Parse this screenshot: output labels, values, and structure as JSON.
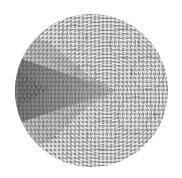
{
  "image": {
    "description": "Circular grayscale hyperbolic tiling pattern with a darker wedge pointing right from the left edge",
    "background_color": "#ffffff",
    "disc": {
      "center_x": 91,
      "center_y": 90,
      "radius": 76,
      "base_color": "#bdbdbd"
    },
    "wedge_color": "#5a5a5a",
    "rosettes": [
      {
        "x": 108,
        "y": 28,
        "r": 14
      },
      {
        "x": 132,
        "y": 58,
        "r": 16
      },
      {
        "x": 120,
        "y": 100,
        "r": 18
      },
      {
        "x": 86,
        "y": 120,
        "r": 14
      },
      {
        "x": 58,
        "y": 22,
        "r": 12
      },
      {
        "x": 40,
        "y": 110,
        "r": 12
      },
      {
        "x": 70,
        "y": 60,
        "r": 10
      },
      {
        "x": 95,
        "y": 75,
        "r": 11
      },
      {
        "x": 140,
        "y": 110,
        "r": 10
      }
    ]
  }
}
